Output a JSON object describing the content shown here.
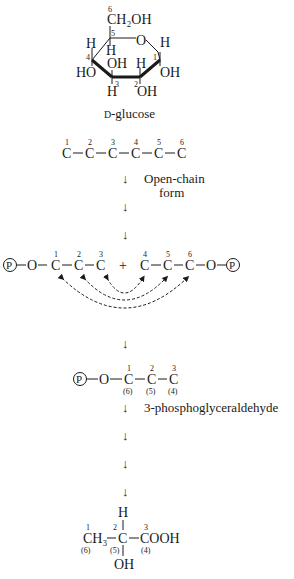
{
  "glucose": {
    "c6_num": "6",
    "ch2oh": "CH₂OH",
    "c5_num": "5",
    "ring_o": "O",
    "c4_h": "H",
    "c5_h": "H",
    "c1_h": "H",
    "c4_num": "4",
    "c1_num": "1",
    "c4_oh": "HO",
    "c3_oh": "OH",
    "c2_h": "H",
    "c1_oh": "OH",
    "c3_num": "3",
    "c2_num": "2",
    "c3_h": "H",
    "c2_oh": "OH",
    "name_prefix": "D",
    "name": "-glucose"
  },
  "open_chain": {
    "carbons": [
      "C",
      "C",
      "C",
      "C",
      "C",
      "C"
    ],
    "numbers": [
      "1",
      "2",
      "3",
      "4",
      "5",
      "6"
    ],
    "label_line1": "Open-chain",
    "label_line2": "form"
  },
  "cleavage": {
    "phosphate": "P",
    "oxygen": "O",
    "left_carbons": [
      "C",
      "C",
      "C"
    ],
    "left_numbers": [
      "1",
      "2",
      "3"
    ],
    "plus": "+",
    "right_carbons": [
      "C",
      "C",
      "C"
    ],
    "right_numbers": [
      "4",
      "5",
      "6"
    ]
  },
  "g3p": {
    "phosphate": "P",
    "oxygen": "O",
    "carbons": [
      "C",
      "C",
      "C"
    ],
    "numbers": [
      "1",
      "2",
      "3"
    ],
    "origin_numbers": [
      "(6)",
      "(5)",
      "(4)"
    ],
    "label": "3-phosphoglyceraldehyde"
  },
  "lactate": {
    "ch3": "CH₃",
    "c1_num": "1",
    "c1_origin": "(6)",
    "c2": "C",
    "c2_num": "2",
    "c2_origin": "(5)",
    "h": "H",
    "oh": "OH",
    "cooh": "COOH",
    "c3_num": "3",
    "c3_origin": "(4)"
  },
  "arrow_glyph": "↓"
}
